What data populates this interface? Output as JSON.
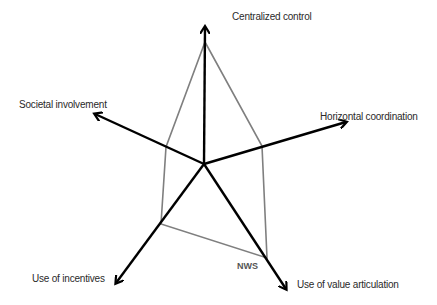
{
  "diagram": {
    "type": "radar",
    "center": [
      204,
      164
    ],
    "colors": {
      "axis": "#000000",
      "polygon": "#7f7f7f",
      "text": "#2a2a2a",
      "series_label": "#555555"
    },
    "axes": [
      {
        "id": "centralized",
        "label": "Centralized control",
        "tip": [
          205,
          27
        ],
        "label_pos": [
          232,
          11
        ]
      },
      {
        "id": "horizontal",
        "label": "Horizontal coordination",
        "tip": [
          346,
          122
        ],
        "label_pos": [
          320,
          111
        ]
      },
      {
        "id": "value",
        "label": "Use of value articulation",
        "tip": [
          286,
          289
        ],
        "label_pos": [
          297,
          279
        ]
      },
      {
        "id": "incentives",
        "label": "Use of incentives",
        "tip": [
          116,
          283
        ],
        "label_pos": [
          32,
          273
        ]
      },
      {
        "id": "societal",
        "label": "Societal involvement",
        "tip": [
          95,
          114
        ],
        "label_pos": [
          19,
          99
        ]
      }
    ],
    "series": [
      {
        "name": "NWS",
        "label_pos": [
          237,
          261
        ],
        "points": [
          [
            205,
            42
          ],
          [
            262,
            146
          ],
          [
            267,
            258
          ],
          [
            161,
            224
          ],
          [
            166,
            147
          ]
        ]
      }
    ]
  },
  "chart_data": {
    "type": "radar",
    "title": "",
    "axes": [
      "Centralized control",
      "Horizontal coordination",
      "Use of value articulation",
      "Use of incentives",
      "Societal involvement"
    ],
    "series": [
      {
        "name": "NWS",
        "values": [
          0.89,
          0.42,
          0.78,
          0.6,
          0.36
        ]
      }
    ],
    "scale": "relative (fraction of axis length)"
  }
}
